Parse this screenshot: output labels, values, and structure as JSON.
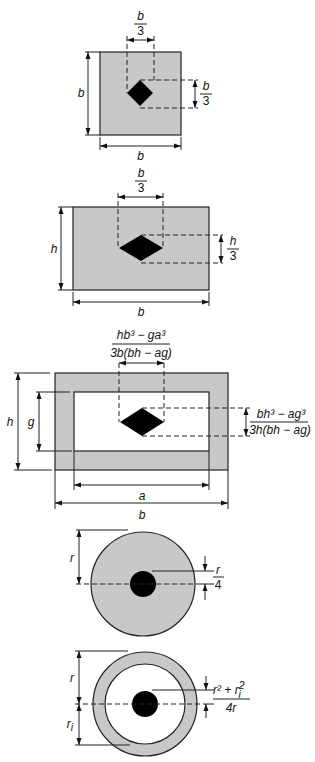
{
  "colors": {
    "section_fill": "#c8c8c8",
    "kern_fill": "#000000",
    "line": "#222222",
    "background": "#ffffff"
  },
  "figures": [
    {
      "name": "square",
      "labels": {
        "side_left": "b",
        "side_bottom": "b",
        "kern_width_num": "b",
        "kern_width_den": "3",
        "kern_height_num": "b",
        "kern_height_den": "3"
      }
    },
    {
      "name": "rectangle",
      "labels": {
        "height": "h",
        "width": "b",
        "kern_width_num": "b",
        "kern_width_den": "3",
        "kern_height_num": "h",
        "kern_height_den": "3"
      }
    },
    {
      "name": "hollow-rectangle",
      "labels": {
        "outer_height": "h",
        "inner_height": "g",
        "inner_width": "a",
        "outer_width": "b",
        "kern_width_num": "hb³ − ga³",
        "kern_width_den": "3b(bh − ag)",
        "kern_height_num": "bh³ − ag³",
        "kern_height_den": "3h(bh − ag)"
      }
    },
    {
      "name": "solid-circle",
      "labels": {
        "radius": "r",
        "kern_radius_num": "r",
        "kern_radius_den": "4"
      }
    },
    {
      "name": "hollow-circle",
      "labels": {
        "outer_radius": "r",
        "inner_radius": "r",
        "inner_radius_sub": "i",
        "kern_radius_num": "r² + r",
        "kern_radius_num_sup": "2",
        "kern_radius_num_sub": "i",
        "kern_radius_den": "4r"
      }
    }
  ]
}
